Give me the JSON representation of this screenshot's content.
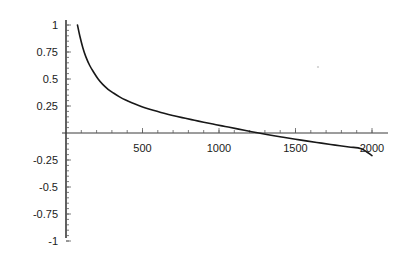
{
  "figure": {
    "background_color": "#ffffff",
    "axis_color": "#3a3a3a",
    "curve_color": "#181818",
    "tick_color": "#5a5a5a",
    "label_color": "#1b1b1b"
  },
  "chart_data": {
    "type": "line",
    "title": "",
    "subtitle": "",
    "xlabel": "",
    "ylabel": "",
    "xlim": [
      0,
      2050
    ],
    "ylim": [
      -1,
      1
    ],
    "grid": false,
    "legend": null,
    "legend_position": "none",
    "x_ticks": [
      500,
      1000,
      1500,
      2000
    ],
    "x_tick_labels": [
      "500",
      "1000",
      "1500",
      "2000"
    ],
    "x_minor_tick_step": 100,
    "y_ticks": [
      1,
      0.75,
      0.5,
      0.25,
      -0.25,
      -0.5,
      -0.75,
      -1
    ],
    "y_tick_labels": [
      "1",
      "0.75",
      "0.5",
      "0.25",
      "-0.25",
      "-0.5",
      "-0.75",
      "-1"
    ],
    "y_minor_tick_step": 0.05,
    "zero_crossing_x": 1060,
    "series": [
      {
        "name": "curve",
        "x": [
          75,
          90,
          110,
          130,
          155,
          180,
          210,
          240,
          275,
          310,
          350,
          390,
          430,
          475,
          520,
          570,
          620,
          670,
          720,
          780,
          840,
          900,
          960,
          1020,
          1060,
          1120,
          1190,
          1260,
          1340,
          1420,
          1500,
          1580,
          1670,
          1760,
          1850,
          1930,
          2000
        ],
        "y": [
          1.0,
          0.9,
          0.79,
          0.705,
          0.625,
          0.565,
          0.5,
          0.45,
          0.405,
          0.37,
          0.335,
          0.305,
          0.28,
          0.255,
          0.232,
          0.21,
          0.19,
          0.172,
          0.155,
          0.136,
          0.118,
          0.1,
          0.083,
          0.066,
          0.055,
          0.038,
          0.018,
          0.0,
          -0.021,
          -0.04,
          -0.058,
          -0.075,
          -0.094,
          -0.112,
          -0.13,
          -0.145,
          -0.21
        ]
      }
    ]
  }
}
